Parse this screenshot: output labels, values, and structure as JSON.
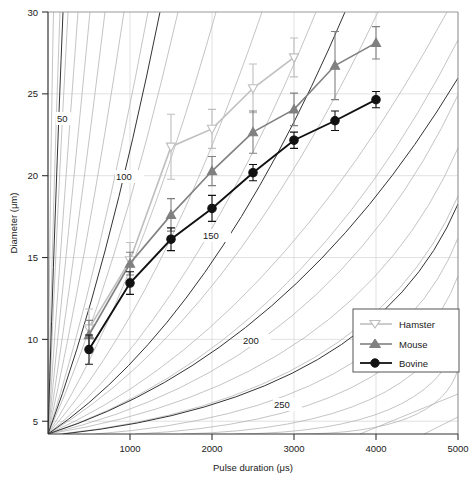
{
  "chart_data": {
    "type": "line",
    "title": "",
    "xlabel": "Pulse duration (μs)",
    "ylabel": "Diameter (μm)",
    "xlim": [
      0,
      5000
    ],
    "ylim": [
      4,
      30
    ],
    "grid": true,
    "legend_position": "bottom-right",
    "xticks": [
      1000,
      2000,
      3000,
      4000,
      5000
    ],
    "xtick_labels": [
      "1000",
      "2000",
      "3000",
      "4000",
      "5000"
    ],
    "yticks": [
      5,
      10,
      15,
      20,
      25,
      30
    ],
    "ytick_labels": [
      "5",
      "10",
      "15",
      "20",
      "25",
      "30"
    ],
    "series": [
      {
        "name": "Hamster",
        "color": "#bfbfbf",
        "marker": "open-triangle-down",
        "x": [
          500,
          1000,
          1500,
          2000,
          2500,
          3000
        ],
        "values": [
          10.5,
          14.7,
          21.7,
          22.8,
          25.3,
          27.2
        ],
        "yerr": [
          1.2,
          1.1,
          2.0,
          1.2,
          1.5,
          1.2
        ]
      },
      {
        "name": "Mouse",
        "color": "#808080",
        "marker": "filled-triangle-up",
        "x": [
          500,
          1000,
          1500,
          2000,
          2500,
          3000,
          3500,
          4000
        ],
        "values": [
          10.1,
          14.5,
          17.5,
          20.2,
          22.6,
          24.0,
          26.7,
          28.1
        ],
        "yerr": [
          0.9,
          0.7,
          1.0,
          0.9,
          1.3,
          1.0,
          2.1,
          1.0
        ]
      },
      {
        "name": "Bovine",
        "color": "#111111",
        "marker": "filled-circle",
        "x": [
          500,
          1000,
          1500,
          2000,
          2500,
          3000,
          3500,
          4000
        ],
        "values": [
          9.2,
          13.3,
          16.0,
          17.9,
          20.1,
          22.1,
          23.3,
          24.6
        ],
        "yerr": [
          0.9,
          0.7,
          0.7,
          0.8,
          0.5,
          0.5,
          0.6,
          0.5
        ]
      }
    ],
    "contours": {
      "labeled_levels": [
        50,
        100,
        150,
        200,
        250
      ],
      "label_positions": [
        {
          "level": "50",
          "x": 330,
          "y": 23.2
        },
        {
          "level": "100",
          "x": 1090,
          "y": 19.6
        },
        {
          "level": "150",
          "x": 2020,
          "y": 15.9
        },
        {
          "level": "200",
          "x": 2630,
          "y": 9.3
        },
        {
          "level": "250",
          "x": 3110,
          "y": 5.4
        }
      ],
      "description": "Family of iso-lines of constant parameter, values 50 to 250",
      "minor_count": 28
    }
  },
  "legend": {
    "entries": [
      {
        "label": "Hamster"
      },
      {
        "label": "Mouse"
      },
      {
        "label": "Bovine"
      }
    ]
  },
  "axes": {
    "x_title": "Pulse duration (μs)",
    "y_title": "Diameter (μm)"
  }
}
